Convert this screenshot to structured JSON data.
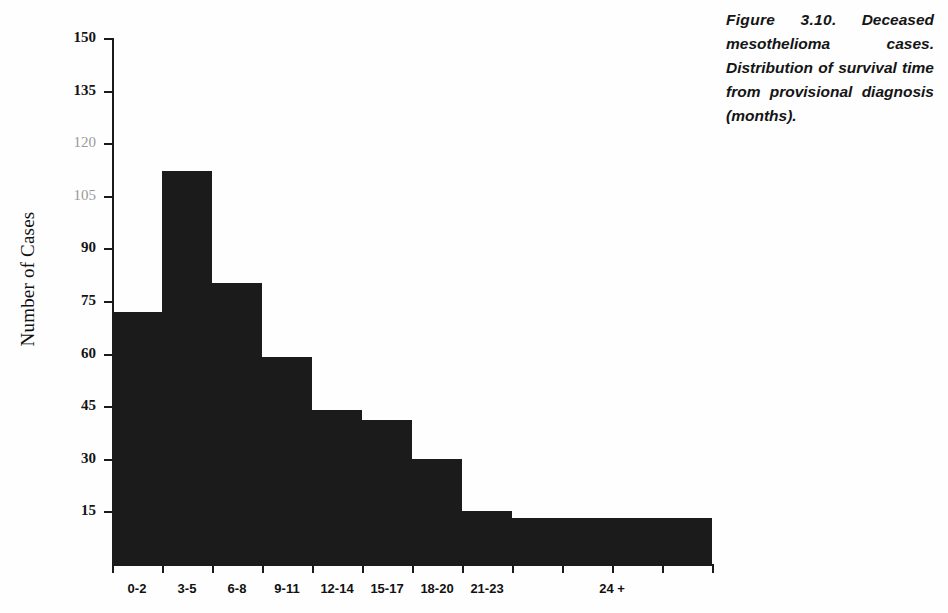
{
  "figure": {
    "caption_label": "Figure 3.10.",
    "caption_text": "Deceased mesothelioma cases. Distribution of survival time from provisional diagnosis (months).",
    "caption_full": "Figure 3.10. Deceased mesothelioma cases. Distribution of survival time from provisional diagnosis (months)."
  },
  "chart_data": {
    "type": "bar",
    "title": "",
    "subtitle": "",
    "xlabel": "",
    "ylabel": "Number of Cases",
    "categories": [
      "0-2",
      "3-5",
      "6-8",
      "9-11",
      "12-14",
      "15-17",
      "18-20",
      "21-23",
      "24 +"
    ],
    "values": [
      72,
      112,
      80,
      59,
      44,
      41,
      30,
      15,
      13
    ],
    "ylim": [
      0,
      150
    ],
    "yticks": [
      15,
      30,
      45,
      60,
      75,
      90,
      105,
      120,
      135,
      150
    ],
    "ytick_labels": [
      "15",
      "30",
      "45",
      "60",
      "75",
      "90",
      "105",
      "120",
      "135",
      "150"
    ],
    "grid": false,
    "legend": null,
    "bar_color": "#1b1b1b",
    "annotations": []
  },
  "axis": {
    "y_title": "Number of Cases",
    "y_ticks": [
      {
        "value": 150,
        "label": "150",
        "faint": false
      },
      {
        "value": 135,
        "label": "135",
        "faint": false
      },
      {
        "value": 120,
        "label": "120",
        "faint": true
      },
      {
        "value": 105,
        "label": "105",
        "faint": true
      },
      {
        "value": 90,
        "label": "90",
        "faint": false
      },
      {
        "value": 75,
        "label": "75",
        "faint": false
      },
      {
        "value": 60,
        "label": "60",
        "faint": false
      },
      {
        "value": 45,
        "label": "45",
        "faint": false
      },
      {
        "value": 30,
        "label": "30",
        "faint": false
      },
      {
        "value": 15,
        "label": "15",
        "faint": false
      }
    ],
    "x_ticks": [
      "0-2",
      "3-5",
      "6-8",
      "9-11",
      "12-14",
      "15-17",
      "18-20",
      "21-23",
      "24 +"
    ]
  },
  "colors": {
    "bar": "#1b1b1b",
    "axis": "#1a1a1a",
    "text": "#141414",
    "faint_text": "#9a9a9a",
    "background": "#ffffff"
  }
}
